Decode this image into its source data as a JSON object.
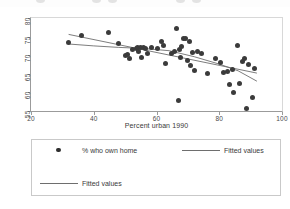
{
  "figure": {
    "axis_title_x": "Percent urban 1990",
    "axis_title_y": "",
    "title": ""
  },
  "legend": {
    "entries": [
      {
        "label": "% who own home",
        "key": "marker-dot",
        "color": "#2e2e2e"
      },
      {
        "label": "Fitted values",
        "key": "line",
        "color": "#6e6e6e"
      },
      {
        "label": "Fitted values",
        "key": "line",
        "color": "#6e6e6e"
      }
    ]
  },
  "chart_data": {
    "type": "scatter",
    "title": "",
    "xlabel": "Percent urban 1990",
    "ylabel": "",
    "xlim": [
      20,
      100
    ],
    "ylim": [
      55,
      80
    ],
    "xticks": [
      20,
      40,
      60,
      80,
      100
    ],
    "yticks": [
      55,
      60,
      65,
      70,
      75,
      80
    ],
    "grid": false,
    "legend_position": "below-plot",
    "marker_color": "#3b3b3b",
    "line_color": "#6e6e6e",
    "series": [
      {
        "name": "% who own home",
        "type": "scatter",
        "points": [
          [
            32.0,
            73.3
          ],
          [
            36.2,
            75.3
          ],
          [
            44.6,
            76.0
          ],
          [
            48.0,
            73.1
          ],
          [
            50.1,
            70.0
          ],
          [
            50.9,
            70.3
          ],
          [
            51.5,
            69.0
          ],
          [
            52.3,
            71.6
          ],
          [
            53.6,
            71.9
          ],
          [
            54.0,
            72.1
          ],
          [
            54.4,
            71.0
          ],
          [
            54.8,
            72.2
          ],
          [
            55.2,
            69.3
          ],
          [
            55.9,
            72.0
          ],
          [
            56.4,
            71.8
          ],
          [
            57.0,
            70.5
          ],
          [
            58.3,
            72.0
          ],
          [
            60.4,
            71.8
          ],
          [
            61.5,
            73.6
          ],
          [
            62.1,
            72.5
          ],
          [
            62.8,
            67.8
          ],
          [
            64.9,
            70.5
          ],
          [
            65.8,
            71.0
          ],
          [
            66.4,
            77.3
          ],
          [
            66.9,
            57.9
          ],
          [
            67.2,
            71.5
          ],
          [
            67.6,
            69.5
          ],
          [
            68.0,
            72.4
          ],
          [
            68.6,
            74.5
          ],
          [
            69.1,
            74.6
          ],
          [
            69.8,
            68.6
          ],
          [
            70.4,
            73.6
          ],
          [
            70.9,
            67.3
          ],
          [
            71.6,
            70.6
          ],
          [
            72.2,
            65.8
          ],
          [
            73.0,
            71.0
          ],
          [
            74.5,
            70.4
          ],
          [
            76.3,
            65.2
          ],
          [
            78.9,
            69.0
          ],
          [
            80.4,
            68.0
          ],
          [
            81.5,
            65.4
          ],
          [
            82.6,
            65.5
          ],
          [
            83.3,
            62.0
          ],
          [
            84.1,
            66.2
          ],
          [
            84.6,
            60.0
          ],
          [
            85.8,
            72.5
          ],
          [
            86.5,
            62.3
          ],
          [
            87.4,
            68.3
          ],
          [
            88.0,
            69.0
          ],
          [
            88.6,
            55.8
          ],
          [
            89.4,
            67.6
          ],
          [
            90.7,
            58.6
          ],
          [
            91.2,
            66.5
          ]
        ]
      },
      {
        "name": "Fitted values",
        "type": "line",
        "note": "linear regression fit",
        "points": [
          [
            32.0,
            75.6
          ],
          [
            92.0,
            65.2
          ]
        ]
      },
      {
        "name": "Fitted values",
        "type": "line",
        "note": "lowess / smoothed fit",
        "points": [
          [
            32.0,
            73.0
          ],
          [
            40.0,
            72.5
          ],
          [
            48.0,
            72.1
          ],
          [
            56.0,
            71.8
          ],
          [
            64.0,
            71.2
          ],
          [
            72.0,
            69.6
          ],
          [
            80.0,
            67.6
          ],
          [
            86.0,
            65.8
          ],
          [
            92.0,
            63.0
          ]
        ]
      }
    ]
  }
}
